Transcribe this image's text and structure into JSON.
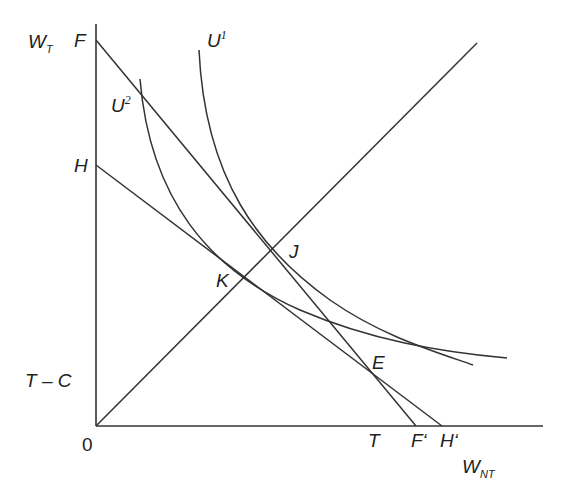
{
  "diagram": {
    "axes": {
      "y_label_main": "W",
      "y_label_sub": "T",
      "x_label_main": "W",
      "x_label_sub": "NT",
      "origin_label": "0"
    },
    "vertical_axis_labels": {
      "F": "F",
      "H": "H",
      "T_minus_C": "T – C"
    },
    "horizontal_axis_labels": {
      "T": "T",
      "F_prime": "F‘",
      "H_prime": "H‘"
    },
    "curves": {
      "U1_main": "U",
      "U1_sup": "1",
      "U2_main": "U",
      "U2_sup": "2"
    },
    "points": {
      "J": "J",
      "K": "K",
      "E": "E"
    },
    "lines": [
      {
        "name": "budget-line-FF'",
        "from": "F",
        "to": "F'"
      },
      {
        "name": "budget-line-HH'",
        "from": "H",
        "to": "H'"
      },
      {
        "name": "45-degree-line",
        "from": "0",
        "to": "top-right"
      }
    ]
  }
}
